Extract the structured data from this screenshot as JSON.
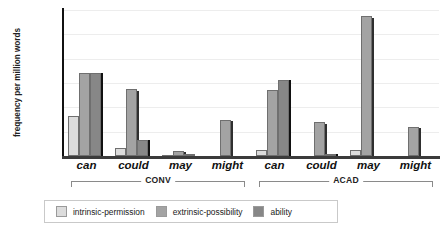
{
  "title_sliver": "frequency of can, could, may, might",
  "axes": {
    "ylabel": "frequency per million words",
    "yticks": [
      "0",
      "500",
      "1000",
      "1500",
      "2000",
      "2500",
      "3000"
    ],
    "ymin": 0,
    "ymax": 3000
  },
  "legend": {
    "items": [
      {
        "label": "intrinsic-permission",
        "color": "#dcdcdc"
      },
      {
        "label": "extrinsic-possibility",
        "color": "#a3a3a3"
      },
      {
        "label": "ability",
        "color": "#878787"
      }
    ]
  },
  "groups": [
    {
      "name": "CONV",
      "label": "CONV"
    },
    {
      "name": "ACAD",
      "label": "ACAD"
    }
  ],
  "xlabels": [
    "can",
    "could",
    "may",
    "might",
    "can",
    "could",
    "may",
    "might"
  ],
  "chart_data": {
    "type": "bar",
    "title": "",
    "xlabel": "",
    "ylabel": "frequency per million words",
    "ylim": [
      0,
      3000
    ],
    "grid": true,
    "legend_position": "bottom",
    "group_labels": [
      "CONV",
      "ACAD"
    ],
    "categories": [
      "CONV can",
      "CONV could",
      "CONV may",
      "CONV might",
      "ACAD can",
      "ACAD could",
      "ACAD may",
      "ACAD might"
    ],
    "series": [
      {
        "name": "intrinsic-permission",
        "color": "#dcdcdc",
        "values": [
          830,
          160,
          30,
          0,
          130,
          0,
          130,
          0
        ]
      },
      {
        "name": "extrinsic-possibility",
        "color": "#a3a3a3",
        "values": [
          1700,
          1370,
          110,
          750,
          1350,
          700,
          2870,
          600
        ]
      },
      {
        "name": "ability",
        "color": "#878787",
        "values": [
          1700,
          330,
          35,
          0,
          1560,
          40,
          0,
          0
        ]
      }
    ]
  }
}
